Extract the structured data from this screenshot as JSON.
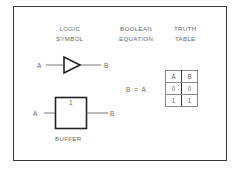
{
  "headers": {
    "symbol": [
      "LOGIC",
      "SYMBOL"
    ],
    "equation": [
      "BOOLEAN",
      "EQUATION"
    ],
    "truth": [
      "TRUTH",
      "TABLE"
    ]
  },
  "symbol_triangle": {
    "input": "A",
    "output": "B"
  },
  "symbol_box": {
    "input": "A",
    "output": "B",
    "inner_label": "1",
    "caption": "BUFFER"
  },
  "equation": "B = A",
  "truth_table": {
    "columns": [
      "A",
      "B"
    ],
    "rows": [
      [
        "0",
        "0"
      ],
      [
        "1",
        "1"
      ]
    ]
  }
}
